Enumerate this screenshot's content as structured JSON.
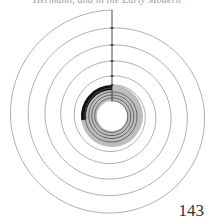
{
  "page": {
    "running_head": "Hermann, and in the Early Modern",
    "page_number": "143"
  },
  "figure": {
    "type": "spiral-diagram",
    "center": [
      112,
      116
    ],
    "outer_spiral": {
      "description": "Archimedean spiral, counterclockwise from top",
      "stroke_color": "#9a9a9a",
      "ring_radii_at_top": [
        106,
        88,
        71,
        55,
        40,
        31
      ]
    },
    "vertical_axis": {
      "stroke_color": "#333333",
      "from_y": 10,
      "to_y": 102
    },
    "gray_band": {
      "fill_color": "#bdbdbd",
      "inner_radius": 15,
      "outer_radius": 31
    },
    "black_segment": {
      "fill_color": "#111111",
      "start_angle_deg": 270,
      "end_angle_deg": 360,
      "inner_radius": 26,
      "outer_radius": 31
    },
    "inner_spiral": {
      "stroke_color": "#555555",
      "ring_radii": [
        28,
        24,
        21,
        18,
        15
      ]
    }
  }
}
